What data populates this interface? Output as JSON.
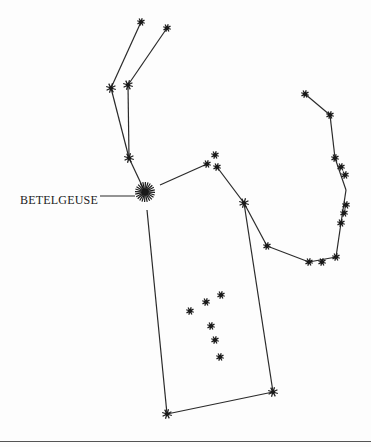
{
  "labels": {
    "betelgeuse": "BETELGEUSE"
  },
  "colors": {
    "ink": "#222222",
    "background": "#fdfdfd"
  },
  "stars": [
    {
      "id": "club1",
      "x": 141,
      "y": 22,
      "r": 4
    },
    {
      "id": "club2",
      "x": 167,
      "y": 28,
      "r": 4
    },
    {
      "id": "club3",
      "x": 111,
      "y": 88,
      "r": 5
    },
    {
      "id": "club4",
      "x": 128,
      "y": 85,
      "r": 5
    },
    {
      "id": "club5",
      "x": 129,
      "y": 158,
      "r": 5
    },
    {
      "id": "betelgeuse",
      "x": 145,
      "y": 192,
      "r": 10
    },
    {
      "id": "bellatrix_a",
      "x": 215,
      "y": 155,
      "r": 4
    },
    {
      "id": "bellatrix_b",
      "x": 207,
      "y": 164,
      "r": 4
    },
    {
      "id": "bellatrix_c",
      "x": 217,
      "y": 167,
      "r": 4
    },
    {
      "id": "shoulder",
      "x": 244,
      "y": 203,
      "r": 5
    },
    {
      "id": "arm1",
      "x": 267,
      "y": 246,
      "r": 4
    },
    {
      "id": "shield1",
      "x": 309,
      "y": 262,
      "r": 4
    },
    {
      "id": "shield2",
      "x": 322,
      "y": 262,
      "r": 4
    },
    {
      "id": "shield3",
      "x": 336,
      "y": 257,
      "r": 4
    },
    {
      "id": "shield4",
      "x": 341,
      "y": 223,
      "r": 4
    },
    {
      "id": "shield5",
      "x": 344,
      "y": 213,
      "r": 4
    },
    {
      "id": "shield6",
      "x": 346,
      "y": 205,
      "r": 4
    },
    {
      "id": "shield7",
      "x": 345,
      "y": 175,
      "r": 4
    },
    {
      "id": "shield8",
      "x": 341,
      "y": 167,
      "r": 4
    },
    {
      "id": "shield9",
      "x": 335,
      "y": 158,
      "r": 4
    },
    {
      "id": "shield10",
      "x": 330,
      "y": 115,
      "r": 4
    },
    {
      "id": "shield11",
      "x": 305,
      "y": 94,
      "r": 4
    },
    {
      "id": "belt1",
      "x": 190,
      "y": 311,
      "r": 4
    },
    {
      "id": "belt2",
      "x": 206,
      "y": 302,
      "r": 4
    },
    {
      "id": "belt3",
      "x": 221,
      "y": 295,
      "r": 4
    },
    {
      "id": "sword1",
      "x": 211,
      "y": 326,
      "r": 4
    },
    {
      "id": "sword2",
      "x": 215,
      "y": 340,
      "r": 4
    },
    {
      "id": "sword3",
      "x": 220,
      "y": 357,
      "r": 4
    },
    {
      "id": "rigel",
      "x": 273,
      "y": 392,
      "r": 5
    },
    {
      "id": "saiph",
      "x": 167,
      "y": 414,
      "r": 5
    }
  ],
  "lines": [
    [
      141,
      22,
      111,
      88
    ],
    [
      167,
      28,
      128,
      85
    ],
    [
      111,
      88,
      129,
      158
    ],
    [
      128,
      85,
      129,
      158
    ],
    [
      129,
      158,
      145,
      192
    ],
    [
      160,
      185,
      207,
      164
    ],
    [
      217,
      167,
      244,
      203
    ],
    [
      244,
      203,
      267,
      246
    ],
    [
      267,
      246,
      309,
      262
    ],
    [
      309,
      262,
      336,
      257
    ],
    [
      336,
      257,
      341,
      223
    ],
    [
      341,
      223,
      346,
      190
    ],
    [
      346,
      190,
      335,
      158
    ],
    [
      335,
      158,
      330,
      115
    ],
    [
      330,
      115,
      305,
      94
    ],
    [
      147,
      210,
      167,
      414
    ],
    [
      244,
      203,
      273,
      392
    ],
    [
      167,
      414,
      273,
      392
    ],
    [
      100,
      196,
      135,
      196
    ]
  ]
}
